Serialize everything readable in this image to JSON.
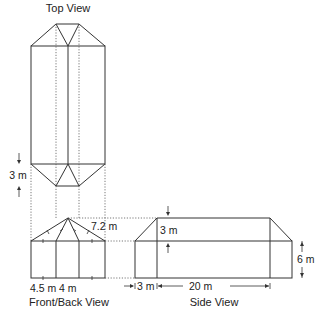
{
  "titles": {
    "top": "Top View",
    "front": "Front/Back View",
    "side": "Side View"
  },
  "dimensions": {
    "top_view_hip": "3 m",
    "front_rafter": "7.2 m",
    "front_outer_bay": "4.5 m",
    "front_inner_bay": "4 m",
    "side_roof_rise": "3 m",
    "side_wall_height": "6 m",
    "side_hip_run": "3 m",
    "side_ridge_length": "20 m"
  },
  "colors": {
    "line": "#333333",
    "hidden_line": "#555555",
    "background": "#ffffff"
  }
}
